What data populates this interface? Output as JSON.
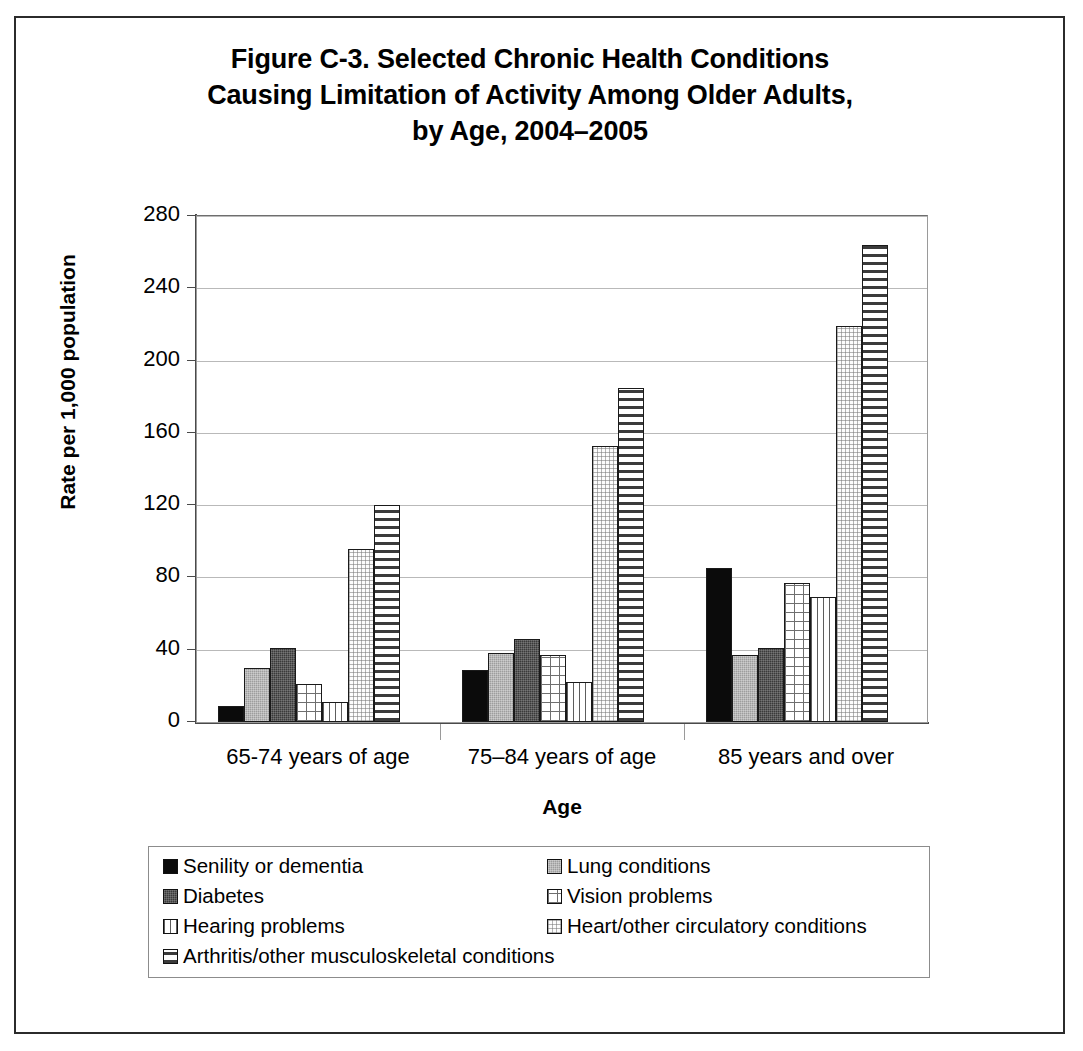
{
  "figure": {
    "title_lines": [
      "Figure C-3. Selected Chronic Health Conditions",
      "Causing Limitation of Activity Among Older Adults,",
      "by Age, 2004–2005"
    ]
  },
  "axes": {
    "y_title": "Rate per 1,000 population",
    "x_title": "Age",
    "y_ticks": [
      "280",
      "240",
      "200",
      "160",
      "120",
      "80",
      "40",
      "0"
    ]
  },
  "chart_data": {
    "type": "bar",
    "title": "Figure C-3. Selected Chronic Health Conditions Causing Limitation of Activity Among Older Adults, by Age, 2004–2005",
    "xlabel": "Age",
    "ylabel": "Rate per 1,000 population",
    "ylim": [
      0,
      280
    ],
    "ytick_step": 40,
    "grid": true,
    "legend_position": "bottom",
    "categories": [
      "65-74 years of age",
      "75–84 years of age",
      "85 years and over"
    ],
    "series": [
      {
        "name": "Senility or dementia",
        "pattern": "solid-black",
        "values": [
          9,
          29,
          85
        ]
      },
      {
        "name": "Lung conditions",
        "pattern": "medium-gray",
        "values": [
          30,
          38,
          37
        ]
      },
      {
        "name": "Diabetes",
        "pattern": "dark-gray",
        "values": [
          41,
          46,
          41
        ]
      },
      {
        "name": "Vision problems",
        "pattern": "grid-hatch",
        "values": [
          21,
          37,
          77
        ]
      },
      {
        "name": "Hearing problems",
        "pattern": "vertical-lines",
        "values": [
          11,
          22,
          69
        ]
      },
      {
        "name": "Heart/other circulatory conditions",
        "pattern": "light-dots",
        "values": [
          96,
          153,
          219
        ]
      },
      {
        "name": "Arthritis/other musculoskeletal conditions",
        "pattern": "horizontal-lines",
        "values": [
          120,
          185,
          264
        ]
      }
    ]
  },
  "legend": {
    "rows": [
      {
        "left": "Senility or dementia",
        "right": "Lung conditions"
      },
      {
        "left": "Diabetes",
        "right": "Vision problems"
      },
      {
        "left": "Hearing problems",
        "right": "Heart/other circulatory conditions"
      },
      {
        "left": "Arthritis/other musculoskeletal conditions",
        "right": ""
      }
    ]
  }
}
